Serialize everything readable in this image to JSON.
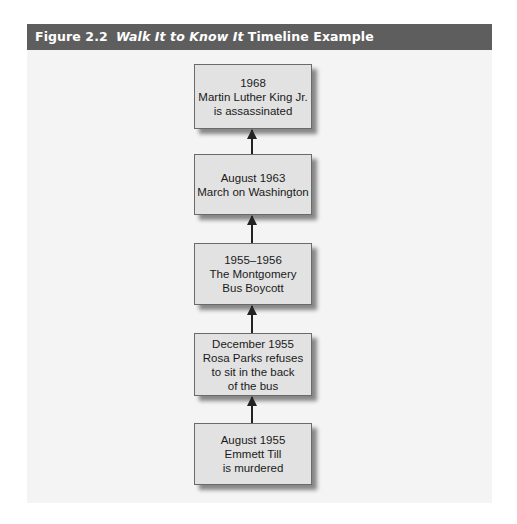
{
  "figure": {
    "number": "Figure 2.2",
    "title_italic": "Walk It to Know It",
    "title_rest": "Timeline Example",
    "colors": {
      "title_bar": "#5e5e5e",
      "panel_background": "#f4f4f4",
      "box_fill": "#e2e2e2",
      "box_border": "#6a6a6a",
      "arrow": "#222222"
    }
  },
  "timeline": {
    "direction": "bottom-to-top",
    "events": [
      {
        "date": "1968",
        "lines": [
          "Martin Luther King Jr.",
          "is assassinated"
        ]
      },
      {
        "date": "August 1963",
        "lines": [
          "March on Washington"
        ]
      },
      {
        "date": "1955–1956",
        "lines": [
          "The Montgomery",
          "Bus Boycott"
        ]
      },
      {
        "date": "December 1955",
        "lines": [
          "Rosa Parks refuses",
          "to sit in the back",
          "of the bus"
        ]
      },
      {
        "date": "August 1955",
        "lines": [
          "Emmett Till",
          "is murdered"
        ]
      }
    ]
  }
}
